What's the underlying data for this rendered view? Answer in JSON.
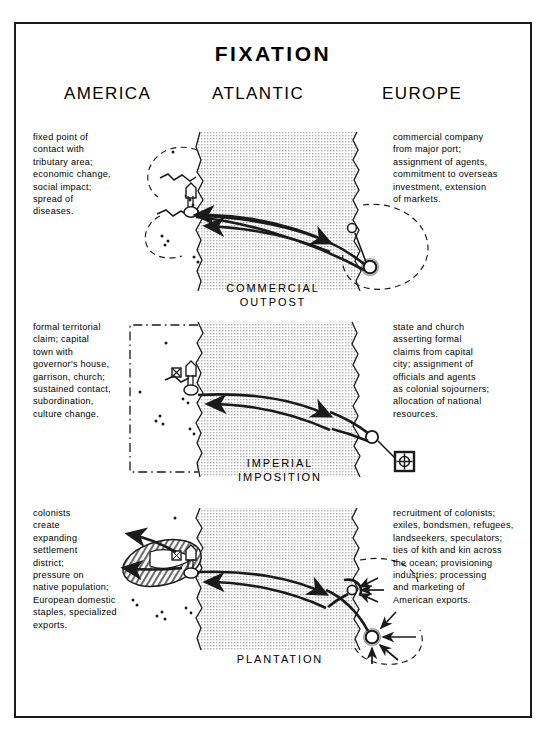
{
  "title": "FIXATION",
  "regions": [
    {
      "key": "america",
      "label": "AMERICA"
    },
    {
      "key": "atlantic",
      "label": "ATLANTIC"
    },
    {
      "key": "europe",
      "label": "EUROPE"
    }
  ],
  "panels": [
    {
      "key": "commercial-outpost",
      "label": "COMMERCIAL\nOUTPOST",
      "america_text": "fixed point of\ncontact with\ntributary area;\neconomic change,\nsocial impact;\nspread of\ndiseases.",
      "europe_text": "commercial company\nfrom major port;\nassignment of agents,\ncommitment to overseas\ninvestment, extension\nof markets.",
      "america_node": "outpost-settlement-symbol",
      "europe_nodes": [
        "minor-port-circle",
        "major-port-double-circle"
      ],
      "hinterland": "dashed-tributary-area",
      "european_field": "dashed-market-circle",
      "flows": [
        "europe-to-america-arrow",
        "america-to-europe-arrow"
      ]
    },
    {
      "key": "imperial-imposition",
      "label": "IMPERIAL\nIMPOSITION",
      "america_text": "formal territorial\nclaim; capital\ntown with\ngovernor's house,\ngarrison, church;\nsustained contact,\nsubordination,\nculture change.",
      "europe_text": "state and church\nasserting formal\nclaims from capital\ncity; assignment of\nofficials and agents\nas colonial sojourners;\nallocation of national\nresources.",
      "america_node": "capital-town-symbol",
      "europe_nodes": [
        "port-circle",
        "capital-city-square-symbol"
      ],
      "hinterland": "dash-dot-territorial-claim",
      "flows": [
        "europe-to-america-arrow",
        "america-to-europe-arrow"
      ]
    },
    {
      "key": "plantation",
      "label": "PLANTATION",
      "america_text": "colonists\ncreate\nexpanding\nsettlement\ndistrict;\npressure on\nnative population;\nEuropean domestic\nstaples, specialized\nexports.",
      "europe_text": "recruitment of colonists;\nexiles, bondsmen, refugees,\nlandseekers, speculators;\nties of kith and kin across\nthe ocean; provisioning\nindustries; processing\nand marketing of\nAmerican exports.",
      "america_node": "expanding-settlement-district-hatched",
      "europe_nodes": [
        "port-circle",
        "metropolis-double-circle"
      ],
      "hinterland": "dashed-recruitment-field",
      "flows": [
        "europe-to-america-arrow",
        "america-to-europe-arrow",
        "inbound-recruitment-arrows"
      ]
    }
  ],
  "colors": {
    "ink": "#1a1a1a",
    "ocean_fill": "#d9d9d9",
    "paper": "#ffffff",
    "hatch": "#808080"
  }
}
